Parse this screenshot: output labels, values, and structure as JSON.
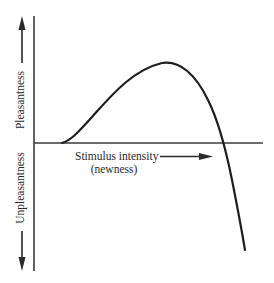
{
  "diagram": {
    "type": "qualitative curve",
    "y_axis": {
      "positive_label": "Pleasantness",
      "negative_label": "Unpleasantness",
      "positive_arrow": "arrow-up",
      "negative_arrow": "arrow-down"
    },
    "x_axis": {
      "label": "Stimulus intensity",
      "sublabel": "(newness)",
      "arrow": "arrow-right"
    },
    "curve": {
      "description": "Inverted-U (Wundt curve): rises from zero at low intensity to a peak of pleasantness at moderate intensity, then falls steeply into unpleasantness at high intensity",
      "points": [
        [
          62,
          143
        ],
        [
          100,
          110
        ],
        [
          130,
          82
        ],
        [
          167,
          63
        ],
        [
          205,
          95
        ],
        [
          225,
          143
        ],
        [
          245,
          250
        ]
      ],
      "color": "#1e1e1e"
    },
    "colors": {
      "background": "#ffffff",
      "ink": "#2a2a2a"
    }
  }
}
